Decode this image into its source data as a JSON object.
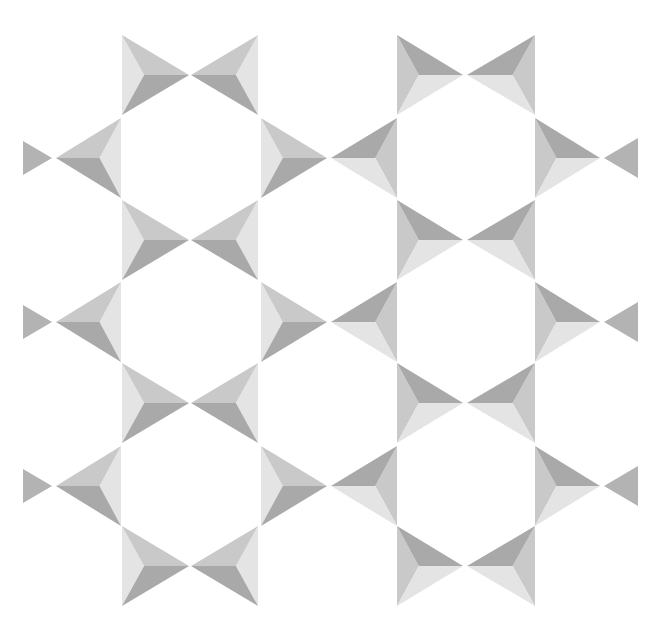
{
  "figure": {
    "background": "#ffffff",
    "shades": {
      "light": "#e4e4e4",
      "mid": "#c9c9c9",
      "dark": "#a9a9a9",
      "tip": "#b3b3b3"
    },
    "half_height": 40,
    "x_rows": [
      75,
      240,
      403,
      566
    ],
    "side_rows": [
      158,
      322,
      486
    ],
    "left_half": {
      "shading": "normal",
      "bowtie": {
        "left_base_x": 122,
        "center_x": 190,
        "right_base_x": 258
      }
    },
    "right_half": {
      "shading": "inverted",
      "bowtie": {
        "left_base_x": 397,
        "center_x": 465,
        "right_base_x": 535
      }
    },
    "side_triangles": {
      "edge_left": {
        "tip_base_x": 23,
        "tip_apex_x": 52,
        "tri_apex_x": 56,
        "tri_base_x": 121
      },
      "middle": {
        "left_base_x": 261,
        "left_apex_x": 327,
        "right_apex_x": 331,
        "right_base_x": 397
      },
      "edge_right": {
        "tri_base_x": 535,
        "tri_apex_x": 600,
        "tip_apex_x": 604,
        "tip_base_x": 638
      }
    }
  }
}
